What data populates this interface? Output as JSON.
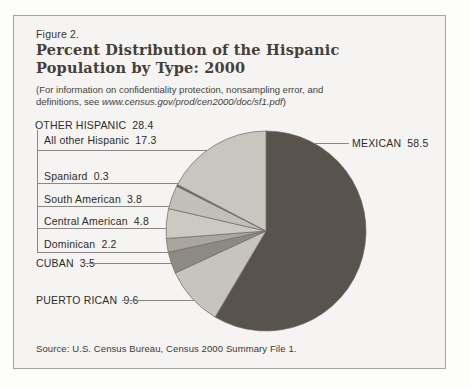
{
  "figure": {
    "label": "Figure 2.",
    "title_line1": "Percent Distribution of the Hispanic",
    "title_line2": "Population by Type: 2000",
    "note_line1": "(For information on confidentiality protection, nonsampling error, and",
    "note_line2_prefix": "definitions, see ",
    "note_url": "www.census.gov/prod/cen2000/doc/sf1.pdf",
    "note_close": ")",
    "source": "Source: U.S. Census Bureau, Census 2000 Summary File 1."
  },
  "labels": {
    "other_hispanic": {
      "text": "OTHER HISPANIC",
      "value": "28.4"
    },
    "all_other": {
      "text": "All other Hispanic",
      "value": "17.3"
    },
    "spaniard": {
      "text": "Spaniard",
      "value": "0.3"
    },
    "south_american": {
      "text": "South American",
      "value": "3.8"
    },
    "central_american": {
      "text": "Central American",
      "value": "4.8"
    },
    "dominican": {
      "text": "Dominican",
      "value": "2.2"
    },
    "cuban": {
      "text": "CUBAN",
      "value": "3.5"
    },
    "puerto_rican": {
      "text": "PUERTO RICAN",
      "value": "9.6"
    },
    "mexican": {
      "text": "MEXICAN",
      "value": "58.5"
    }
  },
  "chart_data": {
    "type": "pie",
    "title": "Percent Distribution of the Hispanic Population by Type: 2000",
    "units": "percent of Hispanic population",
    "start_angle_deg": 0,
    "direction": "clockwise",
    "outline_color": "#6e6a63",
    "slices": [
      {
        "label": "Mexican",
        "value": 58.5,
        "color": "#59534d"
      },
      {
        "label": "Puerto Rican",
        "value": 9.6,
        "color": "#c7c4bf"
      },
      {
        "label": "Cuban",
        "value": 3.5,
        "color": "#8d8983"
      },
      {
        "label": "Dominican",
        "value": 2.2,
        "color": "#aaa69f"
      },
      {
        "label": "Central American",
        "value": 4.8,
        "color": "#ccc9c3"
      },
      {
        "label": "South American",
        "value": 3.8,
        "color": "#c2bfb9"
      },
      {
        "label": "Spaniard",
        "value": 0.3,
        "color": "#6e6962"
      },
      {
        "label": "All other Hispanic",
        "value": 17.3,
        "color": "#c9c6c0"
      }
    ],
    "group": {
      "label": "Other Hispanic",
      "value": 28.4,
      "members": [
        "Dominican",
        "Central American",
        "South American",
        "Spaniard",
        "All other Hispanic"
      ]
    }
  }
}
